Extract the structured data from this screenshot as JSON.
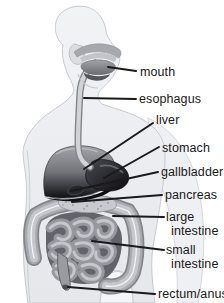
{
  "palette": {
    "background": "#ffffff",
    "body": "#eceef1",
    "body_outline": "#c9cace",
    "organ_dark": "#111113",
    "organ_mid": "#9a9ba1",
    "organ_light": "#c8c9cd",
    "leader_line": "#1a1a1c",
    "label_text": "#19191b"
  },
  "labels": {
    "mouth": "mouth",
    "esophagus": "esophagus",
    "liver": "liver",
    "stomach": "stomach",
    "gallbladder": "gallbladder",
    "pancreas": "pancreas",
    "large_intestine": "large intestine",
    "small_intestine": "small intestine",
    "rectum_anus": "rectum/anus"
  }
}
